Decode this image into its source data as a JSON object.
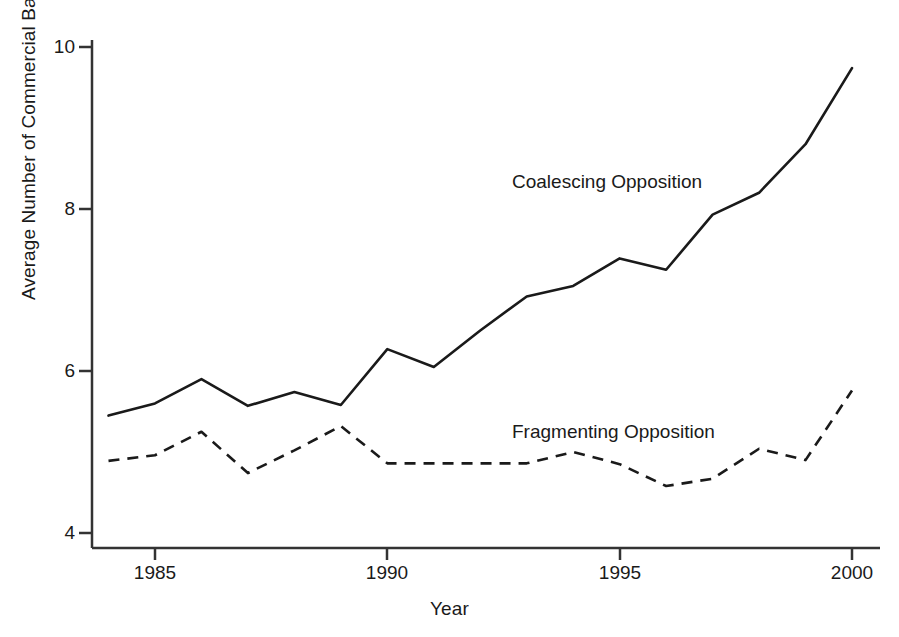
{
  "chart_data": {
    "type": "line",
    "title": "",
    "xlabel": "Year",
    "ylabel": "Average Number of Commercial Banks",
    "xlim": [
      1984,
      2000
    ],
    "ylim": [
      3.6,
      10.1
    ],
    "xticks": [
      1985,
      1990,
      1995,
      2000
    ],
    "yticks": [
      4,
      6,
      8,
      10
    ],
    "grid": false,
    "legend_position": "inline-annotation",
    "x": [
      1984,
      1985,
      1986,
      1987,
      1988,
      1989,
      1990,
      1991,
      1992,
      1993,
      1994,
      1995,
      1996,
      1997,
      1998,
      1999,
      2000
    ],
    "series": [
      {
        "name": "Coalescing Opposition",
        "style": "solid",
        "color": "#1a1a1a",
        "values": [
          5.45,
          5.6,
          5.9,
          5.57,
          5.74,
          5.58,
          6.27,
          6.05,
          6.5,
          6.92,
          7.05,
          7.39,
          7.25,
          7.93,
          8.2,
          8.8,
          9.74
        ]
      },
      {
        "name": "Fragmenting Opposition",
        "style": "dashed",
        "color": "#1a1a1a",
        "values": [
          4.89,
          4.96,
          5.25,
          4.74,
          5.02,
          5.32,
          4.86,
          4.86,
          4.86,
          4.86,
          5.0,
          4.85,
          4.58,
          4.67,
          5.04,
          4.9,
          5.76
        ]
      }
    ],
    "annotations": [
      {
        "text": "Coalescing Opposition",
        "x_px": 512,
        "y_px": 171
      },
      {
        "text": "Fragmenting Opposition",
        "x_px": 512,
        "y_px": 421
      }
    ]
  },
  "axes": {
    "x_tick_labels": [
      "1985",
      "1990",
      "1995",
      "2000"
    ],
    "y_tick_labels": [
      "10",
      "8",
      "6",
      "4"
    ],
    "x_axis_title": "Year",
    "y_axis_title": "Average Number of Commercial Banks"
  }
}
